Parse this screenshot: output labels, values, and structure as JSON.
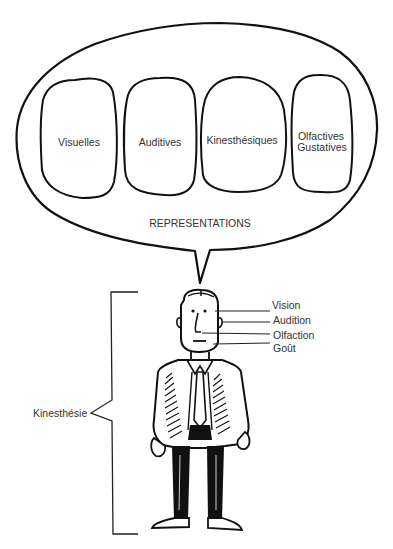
{
  "diagram": {
    "type": "illustration",
    "bubble": {
      "title": "REPRESENTATIONS",
      "boxes": [
        {
          "label": "Visuelles"
        },
        {
          "label": "Auditives"
        },
        {
          "label": "Kinesthésiques"
        },
        {
          "label_line1": "Olfactives",
          "label_line2": "Gustatives"
        }
      ]
    },
    "senses": {
      "items": [
        {
          "label": "Vision"
        },
        {
          "label": "Audition"
        },
        {
          "label": "Olfaction"
        },
        {
          "label": "Goût"
        }
      ]
    },
    "bracket": {
      "label": "Kinesthésie"
    },
    "colors": {
      "stroke": "#111111",
      "text": "#333333",
      "background": "#ffffff"
    }
  }
}
